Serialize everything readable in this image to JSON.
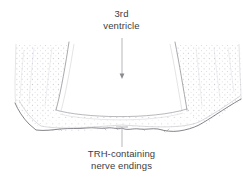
{
  "figure": {
    "type": "anatomical-line-drawing",
    "width": 243,
    "height": 188,
    "background_color": "#ffffff"
  },
  "annotations": {
    "ventricle": {
      "name": "third-ventricle",
      "line1": "3rd",
      "line2": "ventricle",
      "text_color": "#3d3d3d",
      "leader": {
        "kind": "arrow",
        "from_x": 122,
        "from_y": 38,
        "to_x": 122,
        "to_y": 78,
        "color": "#8a8a8a"
      }
    },
    "trh": {
      "name": "trh-containing-nerve-endings",
      "line1": "TRH-containing",
      "line2": "nerve endings",
      "text_color": "#3d3d3d",
      "leader": {
        "kind": "tick",
        "from_x": 122,
        "from_y": 127,
        "to_x": 122,
        "to_y": 147,
        "color": "#9a9a9a"
      }
    }
  },
  "drawing": {
    "stipple": {
      "color": "#c9c9d2",
      "dot_radius": 0.55,
      "spacing": 5.2
    },
    "strokes": {
      "ventricle_wall_color": "#8c8c93",
      "ventricle_wall_width": 0.7,
      "tissue_outline_color": "#a8a8ae",
      "tissue_outline_width": 0.6,
      "basal_surface_color": "#6e6e74",
      "basal_surface_width": 0.8,
      "inner_faint_color": "#c2c2c8",
      "inner_faint_width": 0.5
    },
    "paths": {
      "ventricle_cavity": "M 68,44 L 56,110 L 60,114 L 183,114 L 187,110 L 176,44",
      "ventricle_left_wall": "M 68,44 C 65,62 60,92 56,110",
      "ventricle_right_wall": "M 176,44 C 179,62 184,92 187,110",
      "ventricle_floor": "M 56,110 C 80,118 150,120 187,109",
      "tissue_left_edge": "M 16,46 L 14,104 L 18,112",
      "tissue_right_edge": "M 238,46 L 240,102",
      "basal_surface": "M 16,104 C 22,114 28,122 38,130 C 60,134 95,130 122,128 C 150,130 178,132 200,126 C 218,118 232,108 241,100",
      "tissue_left_inner": "M 44,46 C 42,70 40,94 38,112",
      "tissue_right_inner": "M 205,46 C 207,70 209,94 211,110"
    }
  }
}
